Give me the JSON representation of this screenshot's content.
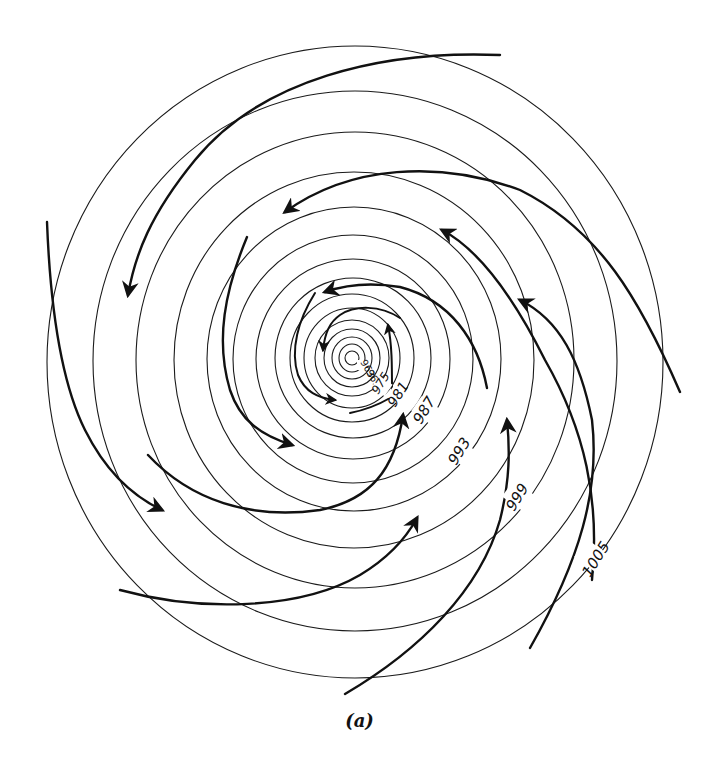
{
  "figure": {
    "caption": "(a)"
  },
  "isobars": {
    "labels": [
      "963",
      "969",
      "975",
      "981",
      "987",
      "993",
      "999",
      "1005"
    ],
    "unit": "mb",
    "ring_count": 15,
    "center_px": [
      352,
      358
    ]
  },
  "streamlines": {
    "count": 14,
    "direction": "counter-clockwise inflow toward center"
  },
  "colors": {
    "ink": "#111111",
    "background": "#ffffff"
  }
}
